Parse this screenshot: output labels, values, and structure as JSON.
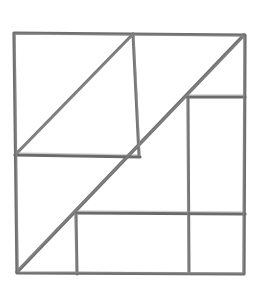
{
  "figure": {
    "title": "Hand-drawn subdivided square",
    "medium": "pencil sketch",
    "canvas": {
      "width": 261,
      "height": 286
    },
    "colors": {
      "background": "#ffffff",
      "stroke": "#6f6f6f",
      "stroke_light": "#8a8a8a",
      "stroke_dark": "#595959"
    },
    "stroke_width": 3,
    "shapes": [
      {
        "name": "outer-square",
        "kind": "quadrilateral",
        "points": "14,33 245,35 244,274 17,273",
        "closed": true,
        "weight": 3.2
      }
    ],
    "segments": [
      {
        "name": "main-diagonal",
        "from": [
          17,
          272
        ],
        "to": [
          244,
          35
        ],
        "weight": 3.4,
        "note": "long diagonal from bottom-left corner to top-right corner"
      },
      {
        "name": "upper-left-diagonal",
        "from": [
          16,
          154
        ],
        "to": [
          133,
          34
        ],
        "weight": 3.0,
        "note": "hypotenuse of the upper-left triangle"
      },
      {
        "name": "upper-vertical-divider",
        "from": [
          133,
          34
        ],
        "to": [
          139,
          156
        ],
        "weight": 3.0,
        "note": "vertical line below top edge meeting the main diagonal"
      },
      {
        "name": "mid-horizontal-divider",
        "from": [
          15,
          155
        ],
        "to": [
          140,
          157
        ],
        "weight": 3.2,
        "note": "horizontal line from left edge to the main diagonal"
      },
      {
        "name": "right-upper-horizontal",
        "from": [
          187,
          97
        ],
        "to": [
          245,
          97
        ],
        "weight": 3.0,
        "note": "top edge of the tall right rectangle"
      },
      {
        "name": "right-vertical-divider",
        "from": [
          188,
          97
        ],
        "to": [
          189,
          273
        ],
        "weight": 3.0,
        "note": "vertical line from the main diagonal down to the bottom edge"
      },
      {
        "name": "lower-horizontal-divider",
        "from": [
          76,
          213
        ],
        "to": [
          245,
          214
        ],
        "weight": 3.2,
        "note": "horizontal line from the main diagonal to the right edge"
      },
      {
        "name": "lower-vertical-divider",
        "from": [
          76,
          213
        ],
        "to": [
          77,
          274
        ],
        "weight": 3.0,
        "note": "vertical line from lower horizontal down to the bottom edge"
      }
    ],
    "regions": [
      {
        "name": "upper-left-triangle",
        "kind": "triangle"
      },
      {
        "name": "upper-right-triangle",
        "kind": "triangle"
      },
      {
        "name": "center-upper-triangle",
        "kind": "triangle"
      },
      {
        "name": "left-lower-triangle",
        "kind": "triangle"
      },
      {
        "name": "tall-right-rectangle",
        "kind": "rectangle"
      },
      {
        "name": "bottom-center-rectangle",
        "kind": "rectangle"
      },
      {
        "name": "bottom-right-rectangle",
        "kind": "rectangle"
      }
    ]
  }
}
